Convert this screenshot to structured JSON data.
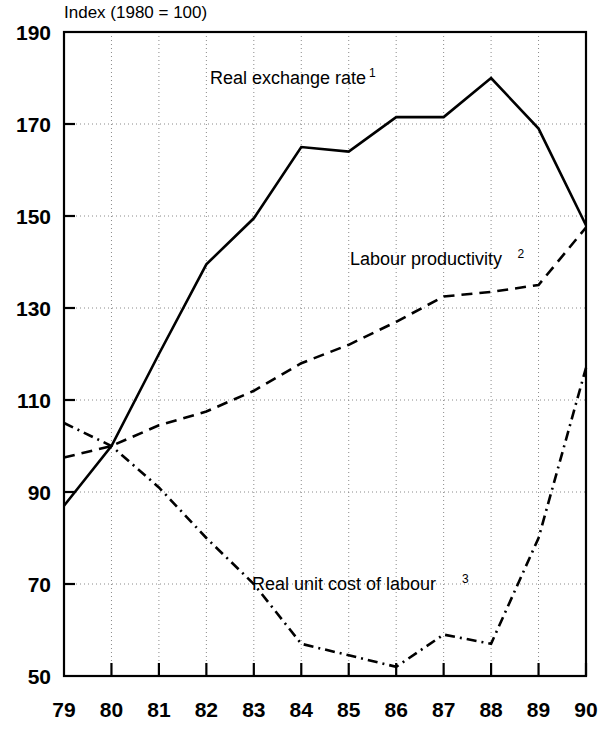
{
  "chart_data": {
    "type": "line",
    "title": "Index (1980 = 100)",
    "xlabel": "",
    "ylabel": "",
    "x": [
      79,
      80,
      81,
      82,
      83,
      84,
      85,
      86,
      87,
      88,
      89,
      90
    ],
    "categories": [
      "79",
      "80",
      "81",
      "82",
      "83",
      "84",
      "85",
      "86",
      "87",
      "88",
      "89",
      "90"
    ],
    "xlim": [
      79,
      90
    ],
    "ylim": [
      50,
      190
    ],
    "yticks": [
      50,
      70,
      90,
      110,
      130,
      150,
      170,
      190
    ],
    "ytick_labels": [
      "50",
      "70",
      "90",
      "110",
      "130",
      "150",
      "170",
      "190"
    ],
    "xticks": [
      80,
      81,
      82,
      83,
      84,
      85,
      86,
      87,
      88,
      89,
      90
    ],
    "grid": true,
    "grid_style": "dotted",
    "legend": "inline-annotations",
    "series": [
      {
        "name": "Real exchange rate 1",
        "label": "Real exchange rate",
        "note": "1",
        "style": "solid",
        "color": "#000000",
        "values": [
          87,
          100,
          120,
          139.5,
          149.5,
          165,
          164,
          171.5,
          171.5,
          180,
          169,
          148
        ]
      },
      {
        "name": "Labour productivity 2",
        "label": "Labour productivity",
        "note": "2",
        "style": "dashed",
        "color": "#000000",
        "values": [
          97.5,
          100,
          104.5,
          107.5,
          112,
          118,
          122,
          127,
          132.5,
          133.5,
          135,
          147.5
        ]
      },
      {
        "name": "Real unit cost of labour 3",
        "label": "Real unit cost of labour",
        "note": "3",
        "style": "dashdot",
        "color": "#000000",
        "values": [
          105,
          100,
          91,
          80,
          70,
          57,
          54.5,
          52,
          59,
          57,
          80,
          117
        ]
      }
    ],
    "annotations": [
      {
        "text": "Real exchange rate",
        "note": "1",
        "x": 210,
        "y": 84
      },
      {
        "text": "Labour productivity",
        "note": "2",
        "x": 350,
        "y": 265
      },
      {
        "text": "Real unit cost of labour",
        "note": "3",
        "x": 252,
        "y": 590
      }
    ]
  },
  "labels": {
    "axis_title": "Index (1980 = 100)"
  }
}
